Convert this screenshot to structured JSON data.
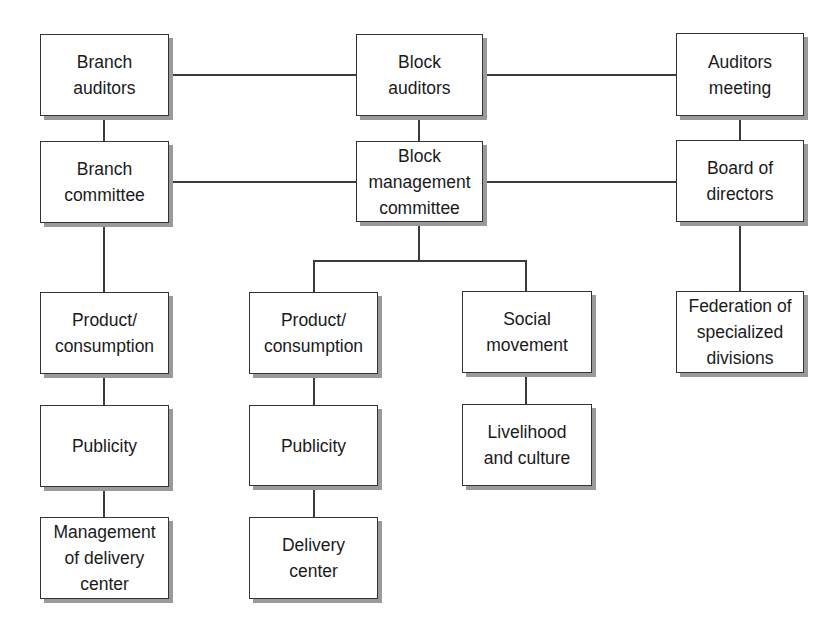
{
  "diagram": {
    "type": "organization-chart",
    "nodes": [
      {
        "id": "branch_auditors",
        "label": "Branch\nauditors",
        "x": 40,
        "y": 34,
        "w": 129,
        "h": 82
      },
      {
        "id": "block_auditors",
        "label": "Block\nauditors",
        "x": 356,
        "y": 34,
        "w": 127,
        "h": 82
      },
      {
        "id": "auditors_meeting",
        "label": "Auditors\nmeeting",
        "x": 676,
        "y": 33,
        "w": 128,
        "h": 83
      },
      {
        "id": "branch_committee",
        "label": "Branch\ncommittee",
        "x": 40,
        "y": 141,
        "w": 129,
        "h": 82
      },
      {
        "id": "block_management_committee",
        "label": "Block\nmanagement\ncommittee",
        "x": 356,
        "y": 141,
        "w": 127,
        "h": 81
      },
      {
        "id": "board_of_directors",
        "label": "Board of\ndirectors",
        "x": 676,
        "y": 140,
        "w": 128,
        "h": 82
      },
      {
        "id": "branch_product_consumption",
        "label": "Product/\nconsumption",
        "x": 40,
        "y": 292,
        "w": 129,
        "h": 82
      },
      {
        "id": "block_product_consumption",
        "label": "Product/\nconsumption",
        "x": 249,
        "y": 292,
        "w": 129,
        "h": 82
      },
      {
        "id": "social_movement",
        "label": "Social\nmovement",
        "x": 462,
        "y": 291,
        "w": 130,
        "h": 82
      },
      {
        "id": "federation_specialized_divisions",
        "label": "Federation of\nspecialized\ndivisions",
        "x": 676,
        "y": 291,
        "w": 128,
        "h": 82
      },
      {
        "id": "branch_publicity",
        "label": "Publicity",
        "x": 40,
        "y": 405,
        "w": 129,
        "h": 82
      },
      {
        "id": "block_publicity",
        "label": "Publicity",
        "x": 249,
        "y": 405,
        "w": 129,
        "h": 81
      },
      {
        "id": "livelihood_culture",
        "label": "Livelihood\nand culture",
        "x": 462,
        "y": 404,
        "w": 130,
        "h": 82
      },
      {
        "id": "management_delivery_center",
        "label": "Management\nof delivery\ncenter",
        "x": 40,
        "y": 517,
        "w": 129,
        "h": 82
      },
      {
        "id": "delivery_center",
        "label": "Delivery\ncenter",
        "x": 249,
        "y": 517,
        "w": 129,
        "h": 82
      }
    ],
    "edges": [
      [
        "branch_auditors",
        "block_auditors"
      ],
      [
        "block_auditors",
        "auditors_meeting"
      ],
      [
        "branch_auditors",
        "branch_committee"
      ],
      [
        "block_auditors",
        "block_management_committee"
      ],
      [
        "auditors_meeting",
        "board_of_directors"
      ],
      [
        "branch_committee",
        "block_management_committee"
      ],
      [
        "block_management_committee",
        "board_of_directors"
      ],
      [
        "branch_committee",
        "branch_product_consumption"
      ],
      [
        "block_management_committee",
        "block_product_consumption"
      ],
      [
        "block_management_committee",
        "social_movement"
      ],
      [
        "board_of_directors",
        "federation_specialized_divisions"
      ],
      [
        "branch_product_consumption",
        "branch_publicity"
      ],
      [
        "branch_publicity",
        "management_delivery_center"
      ],
      [
        "block_product_consumption",
        "block_publicity"
      ],
      [
        "block_publicity",
        "delivery_center"
      ],
      [
        "social_movement",
        "livelihood_culture"
      ]
    ],
    "colors": {
      "line": "#3a3a3a",
      "border": "#333333",
      "shadow": "#9a9a9a",
      "text": "#1a1a1a",
      "background": "#ffffff"
    }
  }
}
